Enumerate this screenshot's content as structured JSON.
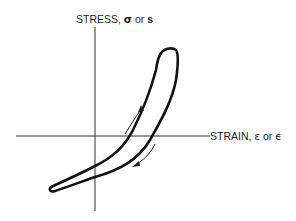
{
  "diagram": {
    "type": "stress-strain hysteresis loop",
    "y_axis": {
      "label": "STRESS,",
      "symbol_1": "σ",
      "connector": "or",
      "symbol_2": "s"
    },
    "x_axis": {
      "label": "STRAIN,",
      "symbol_1": "ε",
      "connector": "or",
      "symbol_2": "ϵ"
    },
    "arrows": [
      {
        "direction": "up-right",
        "meaning": "loading"
      },
      {
        "direction": "down-left",
        "meaning": "unloading"
      }
    ],
    "colors": {
      "line": "#111111",
      "axis": "#333333",
      "background": "#ffffff"
    }
  }
}
